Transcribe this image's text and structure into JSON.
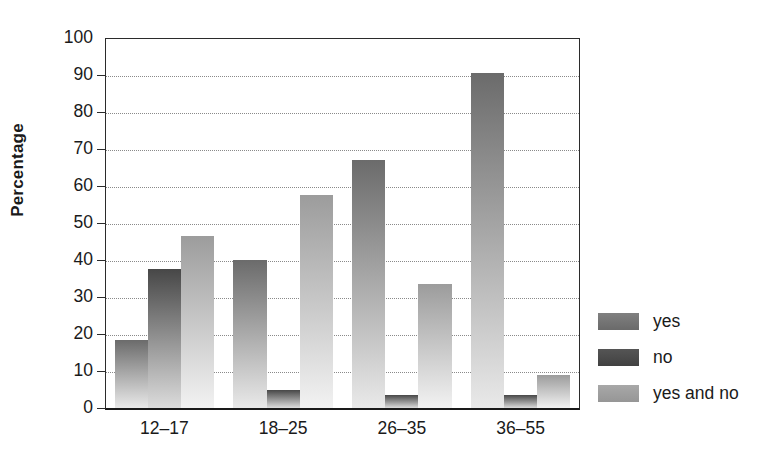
{
  "chart_data": {
    "type": "bar",
    "title": "",
    "subtitle": "",
    "xlabel": "",
    "ylabel": "Percentage",
    "categories": [
      "12–17",
      "18–25",
      "26–35",
      "36–55"
    ],
    "series": [
      {
        "name": "yes",
        "values": [
          18.5,
          40.0,
          67.0,
          90.5
        ],
        "color": "#6e6e6e"
      },
      {
        "name": "no",
        "values": [
          37.5,
          5.0,
          3.5,
          3.5
        ],
        "color": "#4a4a4a"
      },
      {
        "name": "yes and no",
        "values": [
          46.5,
          57.5,
          33.5,
          9.0
        ],
        "color": "#9e9e9e"
      }
    ],
    "ylim": [
      0,
      100
    ],
    "y_ticks": [
      0,
      10,
      20,
      30,
      40,
      50,
      60,
      70,
      80,
      90,
      100
    ],
    "y_tick_labels": [
      "0",
      "10",
      "20",
      "30",
      "40",
      "50",
      "60",
      "70",
      "80",
      "90",
      "100"
    ],
    "grid": true,
    "grid_style": "dotted",
    "grid_axis": "y",
    "legend_position": "right",
    "bar_style": "vertical-gradient-dark-top-to-light-bottom",
    "group_gap": true,
    "annotations": []
  },
  "legend": {
    "items": [
      {
        "label": "yes",
        "swatch_top": "#808080",
        "swatch_bottom": "#6a6a6a"
      },
      {
        "label": "no",
        "swatch_top": "#555555",
        "swatch_bottom": "#414141"
      },
      {
        "label": "yes and no",
        "swatch_top": "#a8a8a8",
        "swatch_bottom": "#969696"
      }
    ]
  },
  "axis": {
    "y_title": "Percentage"
  },
  "colors": {
    "axis_line": "#1a1a1a",
    "gridline": "#8a8a8a",
    "text": "#1a1a1a",
    "background": "#ffffff"
  }
}
